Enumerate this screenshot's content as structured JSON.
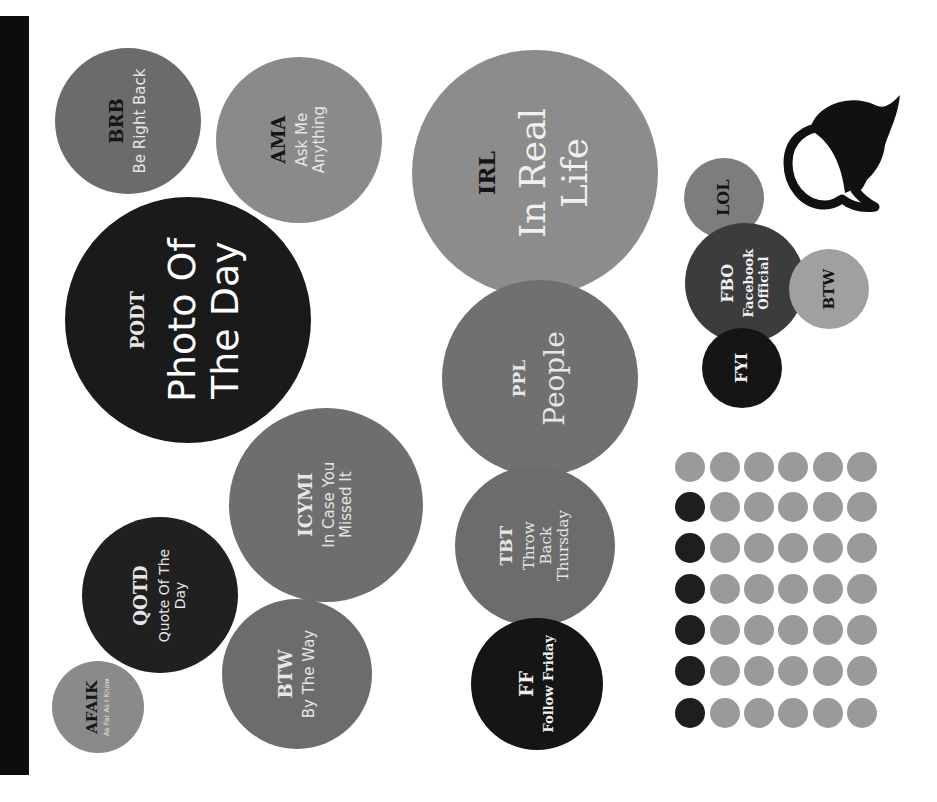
{
  "colors": {
    "background": "#ffffff",
    "side_bar": "#0d0d0d",
    "dot_dark": "#1e1e1e",
    "dot_light": "#9a9a9a",
    "icon": "#111111"
  },
  "bubbles": [
    {
      "id": "brb",
      "abbr": "BRB",
      "full": "Be Right Back",
      "cx": 128,
      "cy": 121,
      "r": 73,
      "fill": "#6b6b6b",
      "abbr_color": "#151515",
      "full_color": "#e6e6e6",
      "abbr_size": 18,
      "full_size": 15,
      "full_font": "sans"
    },
    {
      "id": "ama",
      "abbr": "AMA",
      "full": "Ask Me\nAnything",
      "cx": 299,
      "cy": 140,
      "r": 83,
      "fill": "#8a8a8a",
      "abbr_color": "#151515",
      "full_color": "#e6e6e6",
      "abbr_size": 18,
      "full_size": 15,
      "full_font": "sans"
    },
    {
      "id": "podt",
      "abbr": "PODT",
      "full": "Photo Of\nThe Day",
      "cx": 188,
      "cy": 320,
      "r": 123,
      "fill": "#1a1a1a",
      "abbr_color": "#e6e6e6",
      "full_color": "#ffffff",
      "abbr_size": 18,
      "full_size": 38,
      "full_font": "sans"
    },
    {
      "id": "irl",
      "abbr": "IRL",
      "full": "In Real\nLife",
      "cx": 535,
      "cy": 173,
      "r": 123,
      "fill": "#8c8c8c",
      "abbr_color": "#151515",
      "full_color": "#f0f0f0",
      "abbr_size": 22,
      "full_size": 36,
      "full_font": "serif"
    },
    {
      "id": "ppl",
      "abbr": "PPL",
      "full": "People",
      "cx": 540,
      "cy": 378,
      "r": 98,
      "fill": "#707070",
      "abbr_color": "#e6e6e6",
      "full_color": "#e6e6e6",
      "abbr_size": 17,
      "full_size": 28,
      "full_font": "serif"
    },
    {
      "id": "icymi",
      "abbr": "ICYMI",
      "full": "In Case You\nMissed It",
      "cx": 326,
      "cy": 505,
      "r": 97,
      "fill": "#6e6e6e",
      "abbr_color": "#e6e6e6",
      "full_color": "#e6e6e6",
      "abbr_size": 18,
      "full_size": 15,
      "full_font": "sans"
    },
    {
      "id": "qotd",
      "abbr": "QOTD",
      "full": "Quote Of The\nDay",
      "cx": 160,
      "cy": 595,
      "r": 78,
      "fill": "#202020",
      "abbr_color": "#e6e6e6",
      "full_color": "#e6e6e6",
      "abbr_size": 18,
      "full_size": 14,
      "full_font": "sans"
    },
    {
      "id": "btw-1",
      "abbr": "BTW",
      "full": "By The Way",
      "cx": 297,
      "cy": 674,
      "r": 75,
      "fill": "#6c6c6c",
      "abbr_color": "#e6e6e6",
      "full_color": "#e6e6e6",
      "abbr_size": 18,
      "full_size": 15,
      "full_font": "sans"
    },
    {
      "id": "afaik",
      "abbr": "AFAIK",
      "full": "As Far As I Know",
      "cx": 98,
      "cy": 707,
      "r": 46,
      "fill": "#8a8a8a",
      "abbr_color": "#151515",
      "full_color": "#e6e6e6",
      "abbr_size": 15,
      "full_size": 7,
      "full_font": "sans"
    },
    {
      "id": "tbt",
      "abbr": "TBT",
      "full": "Throw\nBack\nThursday",
      "cx": 535,
      "cy": 546,
      "r": 80,
      "fill": "#6c6c6c",
      "abbr_color": "#e6e6e6",
      "full_color": "#e6e6e6",
      "abbr_size": 17,
      "full_size": 15,
      "full_font": "serif"
    },
    {
      "id": "ff",
      "abbr": "FF",
      "full": "Follow Friday",
      "cx": 537,
      "cy": 684,
      "r": 66,
      "fill": "#151515",
      "abbr_color": "#f0f0f0",
      "full_color": "#f0f0f0",
      "abbr_size": 18,
      "full_size": 13,
      "full_font": "serif-bold"
    },
    {
      "id": "lol",
      "abbr": "LOL",
      "full": "",
      "cx": 724,
      "cy": 198,
      "r": 40,
      "fill": "#7d7d7d",
      "abbr_color": "#151515",
      "full_color": "#151515",
      "abbr_size": 16,
      "full_size": 12,
      "full_font": "serif"
    },
    {
      "id": "fbo",
      "abbr": "FBO",
      "full": "Facebook\nOfficial",
      "cx": 745,
      "cy": 283,
      "r": 60,
      "fill": "#3c3c3c",
      "abbr_color": "#f0f0f0",
      "full_color": "#f0f0f0",
      "abbr_size": 16,
      "full_size": 13,
      "full_font": "serif-bold"
    },
    {
      "id": "btw-2",
      "abbr": "BTW",
      "full": "",
      "cx": 829,
      "cy": 289,
      "r": 40,
      "fill": "#a0a0a0",
      "abbr_color": "#151515",
      "full_color": "#151515",
      "abbr_size": 15,
      "full_size": 12,
      "full_font": "serif"
    },
    {
      "id": "fyi",
      "abbr": "FYI",
      "full": "",
      "cx": 742,
      "cy": 368,
      "r": 40,
      "fill": "#151515",
      "abbr_color": "#f0f0f0",
      "full_color": "#f0f0f0",
      "abbr_size": 16,
      "full_size": 12,
      "full_font": "serif"
    }
  ],
  "dot_grid": {
    "rows": 7,
    "cols": 6,
    "col_x": [
      690,
      725,
      759,
      793,
      828,
      862
    ],
    "row_y": [
      467,
      507,
      548,
      589,
      630,
      671,
      713
    ],
    "pattern": [
      [
        0,
        0,
        0,
        0,
        0,
        0
      ],
      [
        1,
        0,
        0,
        0,
        0,
        0
      ],
      [
        1,
        0,
        0,
        0,
        0,
        0
      ],
      [
        1,
        0,
        0,
        0,
        0,
        0
      ],
      [
        1,
        0,
        0,
        0,
        0,
        0
      ],
      [
        1,
        0,
        0,
        0,
        0,
        0
      ],
      [
        1,
        0,
        0,
        0,
        0,
        0
      ]
    ]
  },
  "icons": {
    "chat": "speech-bubbles-icon"
  }
}
